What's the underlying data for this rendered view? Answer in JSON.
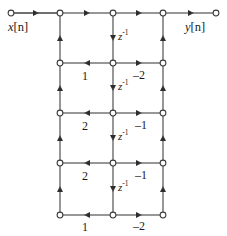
{
  "diagram": {
    "type": "signal-flow-graph",
    "background_color": "#ffffff",
    "line_color": "#4a4a4a",
    "node_fill": "#ffffff",
    "node_stroke": "#3a3a3a",
    "text_color": "#1a1a1a",
    "input": {
      "label_var": "x",
      "label_index": "[n]",
      "label": "x[n]"
    },
    "output": {
      "label_var": "y",
      "label_index": "[n]",
      "label": "y[n]"
    },
    "delay_label_base": "z",
    "delay_label_exp": "-1",
    "delays": [
      {
        "id": "delay-1",
        "label_base": "z",
        "label_exp": "-1"
      },
      {
        "id": "delay-2",
        "label_base": "z",
        "label_exp": "-1"
      },
      {
        "id": "delay-3",
        "label_base": "z",
        "label_exp": "-1"
      },
      {
        "id": "delay-4",
        "label_base": "z",
        "label_exp": "-1"
      }
    ],
    "stages": [
      {
        "id": "stage-1",
        "feedback_gain": "1",
        "feedforward_gain": "–2"
      },
      {
        "id": "stage-2",
        "feedback_gain": "2",
        "feedforward_gain": "–1"
      },
      {
        "id": "stage-3",
        "feedback_gain": "2",
        "feedforward_gain": "–1"
      },
      {
        "id": "stage-4",
        "feedback_gain": "1",
        "feedforward_gain": "–2"
      }
    ],
    "geometry": {
      "col_input": 11,
      "col_left": 60,
      "col_mid": 113,
      "col_right": 163,
      "col_output": 216,
      "row_top": 13,
      "row_1": 63,
      "row_2": 113,
      "row_3": 163,
      "row_4": 215
    }
  }
}
